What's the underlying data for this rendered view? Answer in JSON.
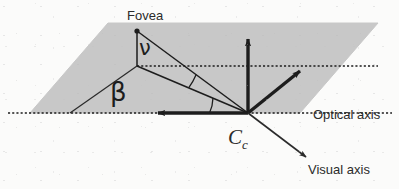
{
  "figure": {
    "background_color": "#fbfbfa",
    "plane_fill_color": "#c8c8c8",
    "stroke_color": "#1d1d1d"
  },
  "labels": {
    "fovea": "Fovea",
    "nu": "ν",
    "beta": "β",
    "center": "C",
    "center_subscript": "c",
    "optical_axis": "Optical axis",
    "visual_axis": "Visual axis"
  },
  "geometry": {
    "plane": {
      "name": "retinal-plane-parallelogram",
      "points": "30,113 108,23 378,23 300,113",
      "fill": "#c8c8c8"
    },
    "points": {
      "fovea_point": {
        "x": 137,
        "y": 31
      },
      "center_Cc": {
        "x": 248,
        "y": 113
      },
      "plane_projection": {
        "x": 137,
        "y": 66
      }
    },
    "axes": [
      {
        "name": "optical-axis",
        "from": "248,113",
        "to": "148,113",
        "arrow": true
      },
      {
        "name": "vertical-axis",
        "from": "248,113",
        "to": "248,30",
        "arrow": true
      },
      {
        "name": "third-axis",
        "from": "248,113",
        "to": "307,66",
        "arrow": true
      },
      {
        "name": "visual-axis",
        "from": "248,113",
        "to": "312,162",
        "arrow": true
      }
    ],
    "dotted_lines": [
      {
        "name": "optical-axis-extension",
        "from": "8,113",
        "to": "392,113"
      },
      {
        "name": "plane-horizontal-guide",
        "from": "137,66",
        "to": "378,66"
      }
    ],
    "solid_lines": [
      {
        "name": "fovea-to-projection",
        "from": "137,31",
        "to": "137,66"
      },
      {
        "name": "fovea-to-center",
        "from": "137,31",
        "to": "248,113"
      },
      {
        "name": "projection-to-center",
        "from": "137,66",
        "to": "248,113"
      },
      {
        "name": "beta-baseline",
        "from": "70,113",
        "to": "137,66"
      }
    ],
    "angle_arcs": [
      {
        "name": "nu-angle-arc",
        "vertex": "248,113",
        "radius": 62
      },
      {
        "name": "beta-angle-arc",
        "vertex": "248,113",
        "radius": 40
      }
    ]
  }
}
